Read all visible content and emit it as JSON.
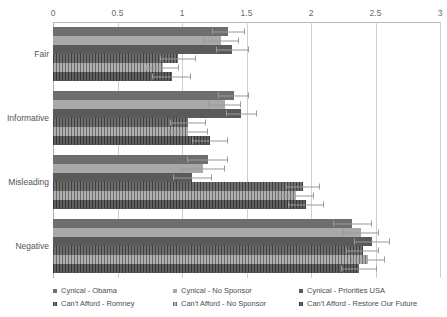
{
  "chart_data": {
    "type": "bar",
    "orientation": "horizontal",
    "title": "",
    "xlabel": "",
    "ylabel": "",
    "xlim": [
      0,
      3
    ],
    "xticks": [
      0,
      0.5,
      1,
      1.5,
      2,
      2.5,
      3
    ],
    "xticklabels": [
      "0",
      "0.5",
      "1",
      "1.5",
      "2",
      "2.5",
      "3"
    ],
    "grid": true,
    "legend_position": "bottom",
    "categories": [
      "Fair",
      "Informative",
      "Misleading",
      "Negative"
    ],
    "series": [
      {
        "name": "Cynical - Obama",
        "color": "#6e6e6e",
        "pattern": "solid",
        "values": [
          1.36,
          1.4,
          1.2,
          2.32
        ],
        "errors": [
          0.13,
          0.12,
          0.16,
          0.15
        ]
      },
      {
        "name": "Cynical - No Sponsor",
        "color": "#a8a8a8",
        "pattern": "solid",
        "values": [
          1.3,
          1.33,
          1.16,
          2.39
        ],
        "errors": [
          0.14,
          0.13,
          0.17,
          0.14
        ]
      },
      {
        "name": "Cynical - Priorities USA",
        "color": "#5a5a5a",
        "pattern": "solid",
        "values": [
          1.39,
          1.46,
          1.08,
          2.47
        ],
        "errors": [
          0.13,
          0.12,
          0.15,
          0.14
        ]
      },
      {
        "name": "Can't Afford - Romney",
        "color": "#6e6e6e",
        "pattern": "hatch",
        "values": [
          0.97,
          1.05,
          1.94,
          2.4
        ],
        "errors": [
          0.14,
          0.14,
          0.13,
          0.13
        ]
      },
      {
        "name": "Can't Afford - No Sponsor",
        "color": "#b0b0b0",
        "pattern": "hatch",
        "values": [
          0.85,
          1.05,
          1.88,
          2.44
        ],
        "errors": [
          0.13,
          0.15,
          0.14,
          0.13
        ]
      },
      {
        "name": "Can't Afford - Restore Our Future",
        "color": "#5f5f5f",
        "pattern": "hatch",
        "values": [
          0.92,
          1.22,
          1.96,
          2.37
        ],
        "errors": [
          0.15,
          0.14,
          0.14,
          0.14
        ]
      }
    ]
  },
  "legend": {
    "columns": [
      {
        "items": [
          "Cynical - Obama",
          "Can't Afford - Romney"
        ]
      },
      {
        "items": [
          "Cynical - No Sponsor",
          "Can't Afford - No Sponsor"
        ]
      },
      {
        "items": [
          "Cynical - Priorities USA",
          "Can't Afford - Restore Our Future"
        ]
      }
    ]
  }
}
